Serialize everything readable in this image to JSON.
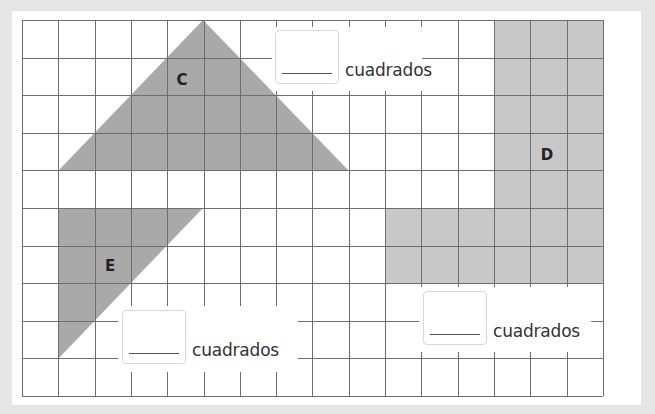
{
  "worksheet": {
    "grid": {
      "left": 22,
      "top": 20,
      "columns": 16,
      "rows": 10,
      "col_width": 36.3,
      "row_height": 37.6,
      "line_color": "#6e6e6e",
      "background": "#ffffff"
    },
    "colors": {
      "page_background": "#e6e6e6",
      "shape_dark": "#a9a9a9",
      "shape_light": "#c8c8c8"
    },
    "shapes": [
      {
        "id": "C",
        "label": "C",
        "type": "triangle",
        "points": "203,20 349,171 58,171",
        "fill": "#a9a9a9"
      },
      {
        "id": "D",
        "label": "D",
        "type": "polygon",
        "points": "494,20 603,20 603,284 385,284 385,208 494,208",
        "fill": "#c8c8c8"
      },
      {
        "id": "E",
        "label": "E",
        "type": "triangle",
        "points": "58,208 203,208 58,359",
        "fill": "#a9a9a9"
      }
    ],
    "answers": [
      {
        "shape": "C",
        "value": "",
        "unit": "cuadrados"
      },
      {
        "shape": "D",
        "value": "",
        "unit": "cuadrados"
      },
      {
        "shape": "E",
        "value": "",
        "unit": "cuadrados"
      }
    ]
  }
}
